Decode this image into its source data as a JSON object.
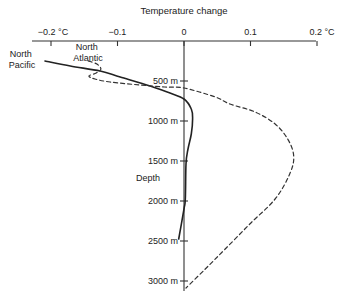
{
  "chart_data": {
    "type": "line",
    "title": "Temperature change",
    "xlabel": "Temperature change",
    "ylabel": "Depth",
    "xlim": [
      -0.2,
      0.2
    ],
    "ylim": [
      0,
      3100
    ],
    "y_inverted": true,
    "x_ticks": [
      {
        "value": -0.2,
        "label": "−0.2 °C"
      },
      {
        "value": -0.1,
        "label": "−0.1"
      },
      {
        "value": 0,
        "label": "0"
      },
      {
        "value": 0.1,
        "label": "0.1"
      },
      {
        "value": 0.2,
        "label": "0.2 °C"
      }
    ],
    "y_ticks": [
      {
        "value": 500,
        "label": "500 m"
      },
      {
        "value": 1000,
        "label": "1000 m"
      },
      {
        "value": 1500,
        "label": "1500 m"
      },
      {
        "value": 2000,
        "label": "2000 m"
      },
      {
        "value": 2500,
        "label": "2500 m"
      },
      {
        "value": 3000,
        "label": "3000 m"
      }
    ],
    "grid": false,
    "legend": "inline-labels-top-left",
    "series": [
      {
        "name": "North Pacific",
        "label_lines": [
          "North",
          "Pacific"
        ],
        "style": "solid",
        "color": "#222222",
        "points": [
          [
            -0.209,
            250
          ],
          [
            -0.171,
            313
          ],
          [
            -0.126,
            375
          ],
          [
            -0.096,
            450
          ],
          [
            -0.051,
            563
          ],
          [
            -0.021,
            650
          ],
          [
            0.0,
            725
          ],
          [
            0.011,
            850
          ],
          [
            0.013,
            975
          ],
          [
            0.011,
            1163
          ],
          [
            0.006,
            1350
          ],
          [
            0.003,
            1538
          ],
          [
            0.002,
            1975
          ],
          [
            0.0,
            2100
          ],
          [
            -0.008,
            2475
          ]
        ]
      },
      {
        "name": "North Atlantic",
        "label_lines": [
          "North",
          "Atlantic"
        ],
        "style": "dashed",
        "color": "#333333",
        "points": [
          [
            -0.144,
            250
          ],
          [
            -0.131,
            288
          ],
          [
            -0.125,
            350
          ],
          [
            -0.132,
            400
          ],
          [
            -0.143,
            438
          ],
          [
            -0.134,
            475
          ],
          [
            -0.111,
            513
          ],
          [
            -0.066,
            550
          ],
          [
            -0.029,
            575
          ],
          [
            0.0,
            588
          ],
          [
            0.047,
            700
          ],
          [
            0.069,
            788
          ],
          [
            0.107,
            888
          ],
          [
            0.137,
            1038
          ],
          [
            0.156,
            1225
          ],
          [
            0.165,
            1438
          ],
          [
            0.159,
            1663
          ],
          [
            0.137,
            1975
          ],
          [
            0.099,
            2288
          ],
          [
            0.062,
            2600
          ],
          [
            0.032,
            2850
          ],
          [
            0.003,
            3088
          ]
        ]
      }
    ]
  }
}
